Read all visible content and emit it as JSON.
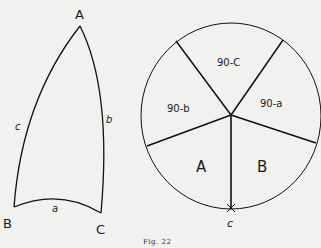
{
  "figure": {
    "caption": "Fig. 22",
    "triangle": {
      "vertices": {
        "A": "A",
        "B": "B",
        "C": "C"
      },
      "sides": {
        "a": "a",
        "b": "b",
        "c": "c"
      }
    },
    "napier_circle": {
      "segments": [
        "90-C",
        "90-a",
        "B",
        "A",
        "90-b"
      ],
      "bottom_label": "c"
    }
  }
}
